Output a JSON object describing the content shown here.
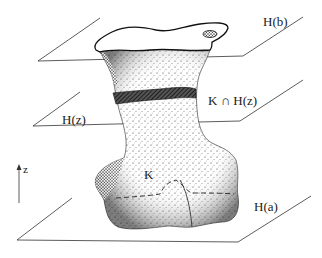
{
  "figure": {
    "type": "3d-slicing-diagram",
    "colors": {
      "ink": "#1a1a1a",
      "background": "#ffffff",
      "stipple": "#2a2a2a"
    }
  },
  "labels": {
    "plane_top": "H(b)",
    "plane_mid": "H(z)",
    "plane_bottom": "H(a)",
    "section": "K ∩ H(z)",
    "body": "K",
    "axis": "z"
  }
}
